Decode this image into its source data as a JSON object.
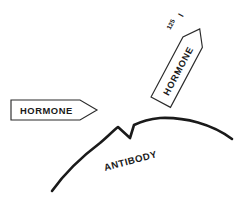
{
  "figure": {
    "background_color": "#ffffff",
    "ink_color": "#1a1a1a",
    "outline_color": "#2b2b2b",
    "width": 245,
    "height": 200
  },
  "labels": {
    "hormone_unlabeled": "HORMONE",
    "hormone_labeled": "HORMONE",
    "antibody": "ANTIBODY",
    "isotope_mass_number": "125",
    "isotope_symbol": "I",
    "isotope_full": "125I"
  },
  "elements": {
    "arrow_horizontal": {
      "name": "unlabeled-hormone-arrow",
      "label": "HORMONE",
      "direction": "right",
      "rotation_deg": 0
    },
    "arrow_rotated": {
      "name": "labeled-hormone-arrow",
      "label": "HORMONE",
      "direction": "down-left",
      "rotation_deg": -62
    },
    "antibody_curve": {
      "name": "antibody-surface-curve",
      "label": "ANTIBODY",
      "feature": "binding-site-notch",
      "label_rotation_deg": -15
    }
  }
}
